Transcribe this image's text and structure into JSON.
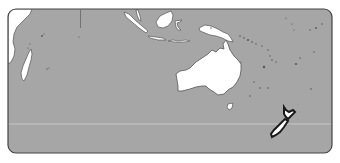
{
  "map": {
    "region": "Oceania / Indian Ocean",
    "highlighted_country": "New Zealand",
    "colors": {
      "ocean": "#a6a6a6",
      "land": "#ffffff",
      "outline": "#555555",
      "highlight_outline": "#1a1a1a",
      "frame": "#444444",
      "graticule": "#cfcfcf",
      "background": "#ffffff"
    },
    "features": [
      {
        "name": "Africa (east coast)"
      },
      {
        "name": "Madagascar"
      },
      {
        "name": "Sumatra"
      },
      {
        "name": "Borneo"
      },
      {
        "name": "Sulawesi"
      },
      {
        "name": "Java"
      },
      {
        "name": "New Guinea"
      },
      {
        "name": "Australia"
      },
      {
        "name": "Tasmania"
      },
      {
        "name": "New Zealand"
      }
    ]
  }
}
